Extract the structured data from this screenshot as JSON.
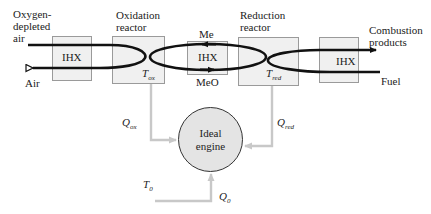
{
  "diagram": {
    "labels": {
      "oxygen_depleted_air_line1": "Oxygen-",
      "oxygen_depleted_air_line2": "depleted",
      "oxygen_depleted_air_line3": "air",
      "air": "Air",
      "oxidation_reactor_line1": "Oxidation",
      "oxidation_reactor_line2": "reactor",
      "reduction_reactor_line1": "Reduction",
      "reduction_reactor_line2": "reactor",
      "combustion_products_line1": "Combustion",
      "combustion_products_line2": "products",
      "fuel": "Fuel",
      "me": "Me",
      "meo": "MeO"
    },
    "heat_exchangers": [
      {
        "label": "IHX"
      },
      {
        "label": "IHX"
      },
      {
        "label": "IHX"
      }
    ],
    "variables": {
      "t_ox": {
        "symbol": "T",
        "sub": "ox"
      },
      "t_red": {
        "symbol": "T",
        "sub": "red"
      },
      "q_ox": {
        "symbol": "Q",
        "sub": "ox"
      },
      "q_red": {
        "symbol": "Q",
        "sub": "red"
      },
      "t_0": {
        "symbol": "T",
        "sub": "0"
      },
      "q_0": {
        "symbol": "Q",
        "sub": "0"
      }
    },
    "engine": {
      "line1": "Ideal",
      "line2": "engine"
    },
    "colors": {
      "box_fill": "#f0f0f0",
      "box_border": "#9a9a9a",
      "flow_line": "#111111",
      "heat_line": "#c8c8c8",
      "engine_fill": "#e4e4e4"
    }
  }
}
